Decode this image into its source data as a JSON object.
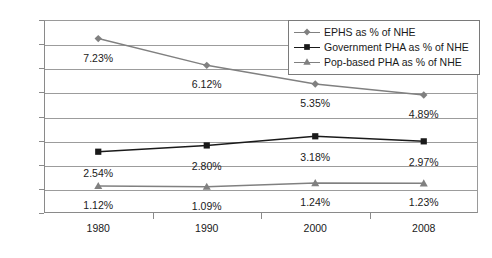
{
  "chart_data": {
    "type": "line",
    "title": "",
    "xlabel": "",
    "ylabel": "",
    "categories": [
      "1980",
      "1990",
      "2000",
      "2008"
    ],
    "ylim": [
      0,
      8
    ],
    "ytick_labels": [
      "0.0%",
      "1.0%",
      "2.0%",
      "3.0%",
      "4.0%",
      "5.0%",
      "6.0%",
      "7.0%",
      "8.0%"
    ],
    "ytick_values": [
      0,
      1,
      2,
      3,
      4,
      5,
      6,
      7,
      8
    ],
    "grid": "horizontal",
    "legend_position": "top-right",
    "series": [
      {
        "name": "EPHS as % of NHE",
        "marker": "diamond",
        "color": "#808080",
        "values": [
          7.23,
          6.12,
          5.35,
          4.89
        ],
        "labels": [
          "7.23%",
          "6.12%",
          "5.35%",
          "4.89%"
        ]
      },
      {
        "name": "Government PHA as % of NHE",
        "marker": "square",
        "color": "#1a1a1a",
        "values": [
          2.54,
          2.8,
          3.18,
          2.97
        ],
        "labels": [
          "2.54%",
          "2.80%",
          "3.18%",
          "2.97%"
        ]
      },
      {
        "name": "Pop-based PHA as % of NHE",
        "marker": "triangle",
        "color": "#808080",
        "values": [
          1.12,
          1.09,
          1.24,
          1.23
        ],
        "labels": [
          "1.12%",
          "1.09%",
          "1.24%",
          "1.23%"
        ]
      }
    ]
  }
}
